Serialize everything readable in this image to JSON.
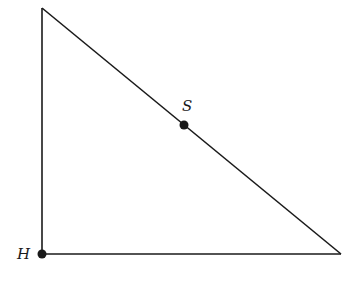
{
  "diagram": {
    "type": "right triangle",
    "vertices": {
      "top": [
        42,
        8
      ],
      "bottom_left": [
        42,
        254
      ],
      "bottom_right": [
        341,
        254
      ]
    },
    "points": [
      {
        "label": "S",
        "x": 184,
        "y": 125,
        "label_x": 184,
        "label_y": 112
      },
      {
        "label": "H",
        "x": 42,
        "y": 254,
        "label_x": 17,
        "label_y": 259
      }
    ],
    "colors": {
      "stroke": "#1a1a1a",
      "background": "#ffffff"
    }
  }
}
